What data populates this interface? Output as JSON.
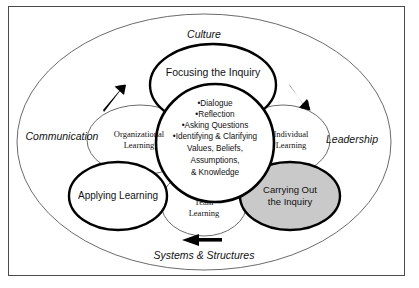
{
  "figure": {
    "outer_labels": [
      {
        "id": "culture",
        "text": "Culture"
      },
      {
        "id": "communication",
        "text": "Communication"
      },
      {
        "id": "leadership",
        "text": "Leadership"
      },
      {
        "id": "systems-structures",
        "text": "Systems & Structures"
      }
    ],
    "process_circles": [
      {
        "id": "focusing",
        "text": "Focusing the Inquiry"
      },
      {
        "id": "carrying-out",
        "text_line1": "Carrying Out",
        "text_line2": "the Inquiry"
      },
      {
        "id": "applying",
        "text": "Applying Learning"
      }
    ],
    "learning_ellipses": [
      {
        "id": "organizational",
        "line1": "Organizational",
        "line2": "Learning"
      },
      {
        "id": "individual",
        "line1": "Individual",
        "line2": "Learning"
      },
      {
        "id": "team",
        "line1": "Team",
        "line2": "Learning"
      }
    ],
    "core": {
      "bullets": [
        "•Dialogue",
        "•Reflection",
        "•Asking Questions",
        "•Identifying & Clarifying"
      ],
      "continuation": [
        "Values, Beliefs,",
        "Assumptions,",
        "& Knowledge"
      ]
    },
    "arrows": [
      {
        "id": "arrow-upper-left",
        "direction": "up-right"
      },
      {
        "id": "arrow-upper-right",
        "direction": "down-right"
      },
      {
        "id": "arrow-bottom",
        "direction": "left"
      }
    ],
    "colors": {
      "shaded_fill": "#c9c9c9",
      "thick_stroke": "#000000",
      "thin_stroke": "#6b6b6b",
      "frame": "#4a4a52",
      "background": "#ffffff",
      "text": "#111111"
    }
  }
}
